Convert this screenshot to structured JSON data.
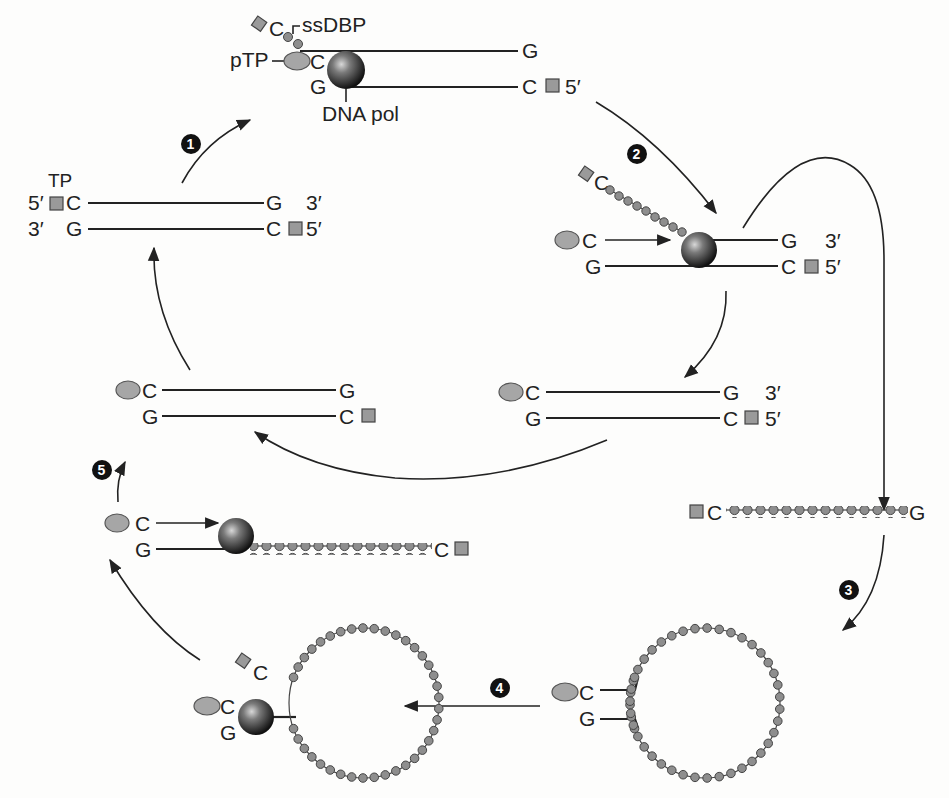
{
  "diagram": {
    "type": "DNA replication cycle (protein-primed, strand displacement)",
    "labels": {
      "ssdbp": "ssDBP",
      "ptp": "pTP",
      "dna_pol": "DNA pol",
      "tp": "TP",
      "five_prime": "5′",
      "three_prime": "3′",
      "base_c": "C",
      "base_g": "G"
    },
    "steps": [
      {
        "number": "1"
      },
      {
        "number": "2"
      },
      {
        "number": "3"
      },
      {
        "number": "4"
      },
      {
        "number": "5"
      }
    ],
    "colors": {
      "strand": "#222222",
      "bead": "#8e8e8e",
      "terminal_protein": "#9a9a9a",
      "polymerase_dark": "#1a1a1a",
      "polymerase_light": "#bfbfbf",
      "step_badge": "#111111"
    }
  }
}
